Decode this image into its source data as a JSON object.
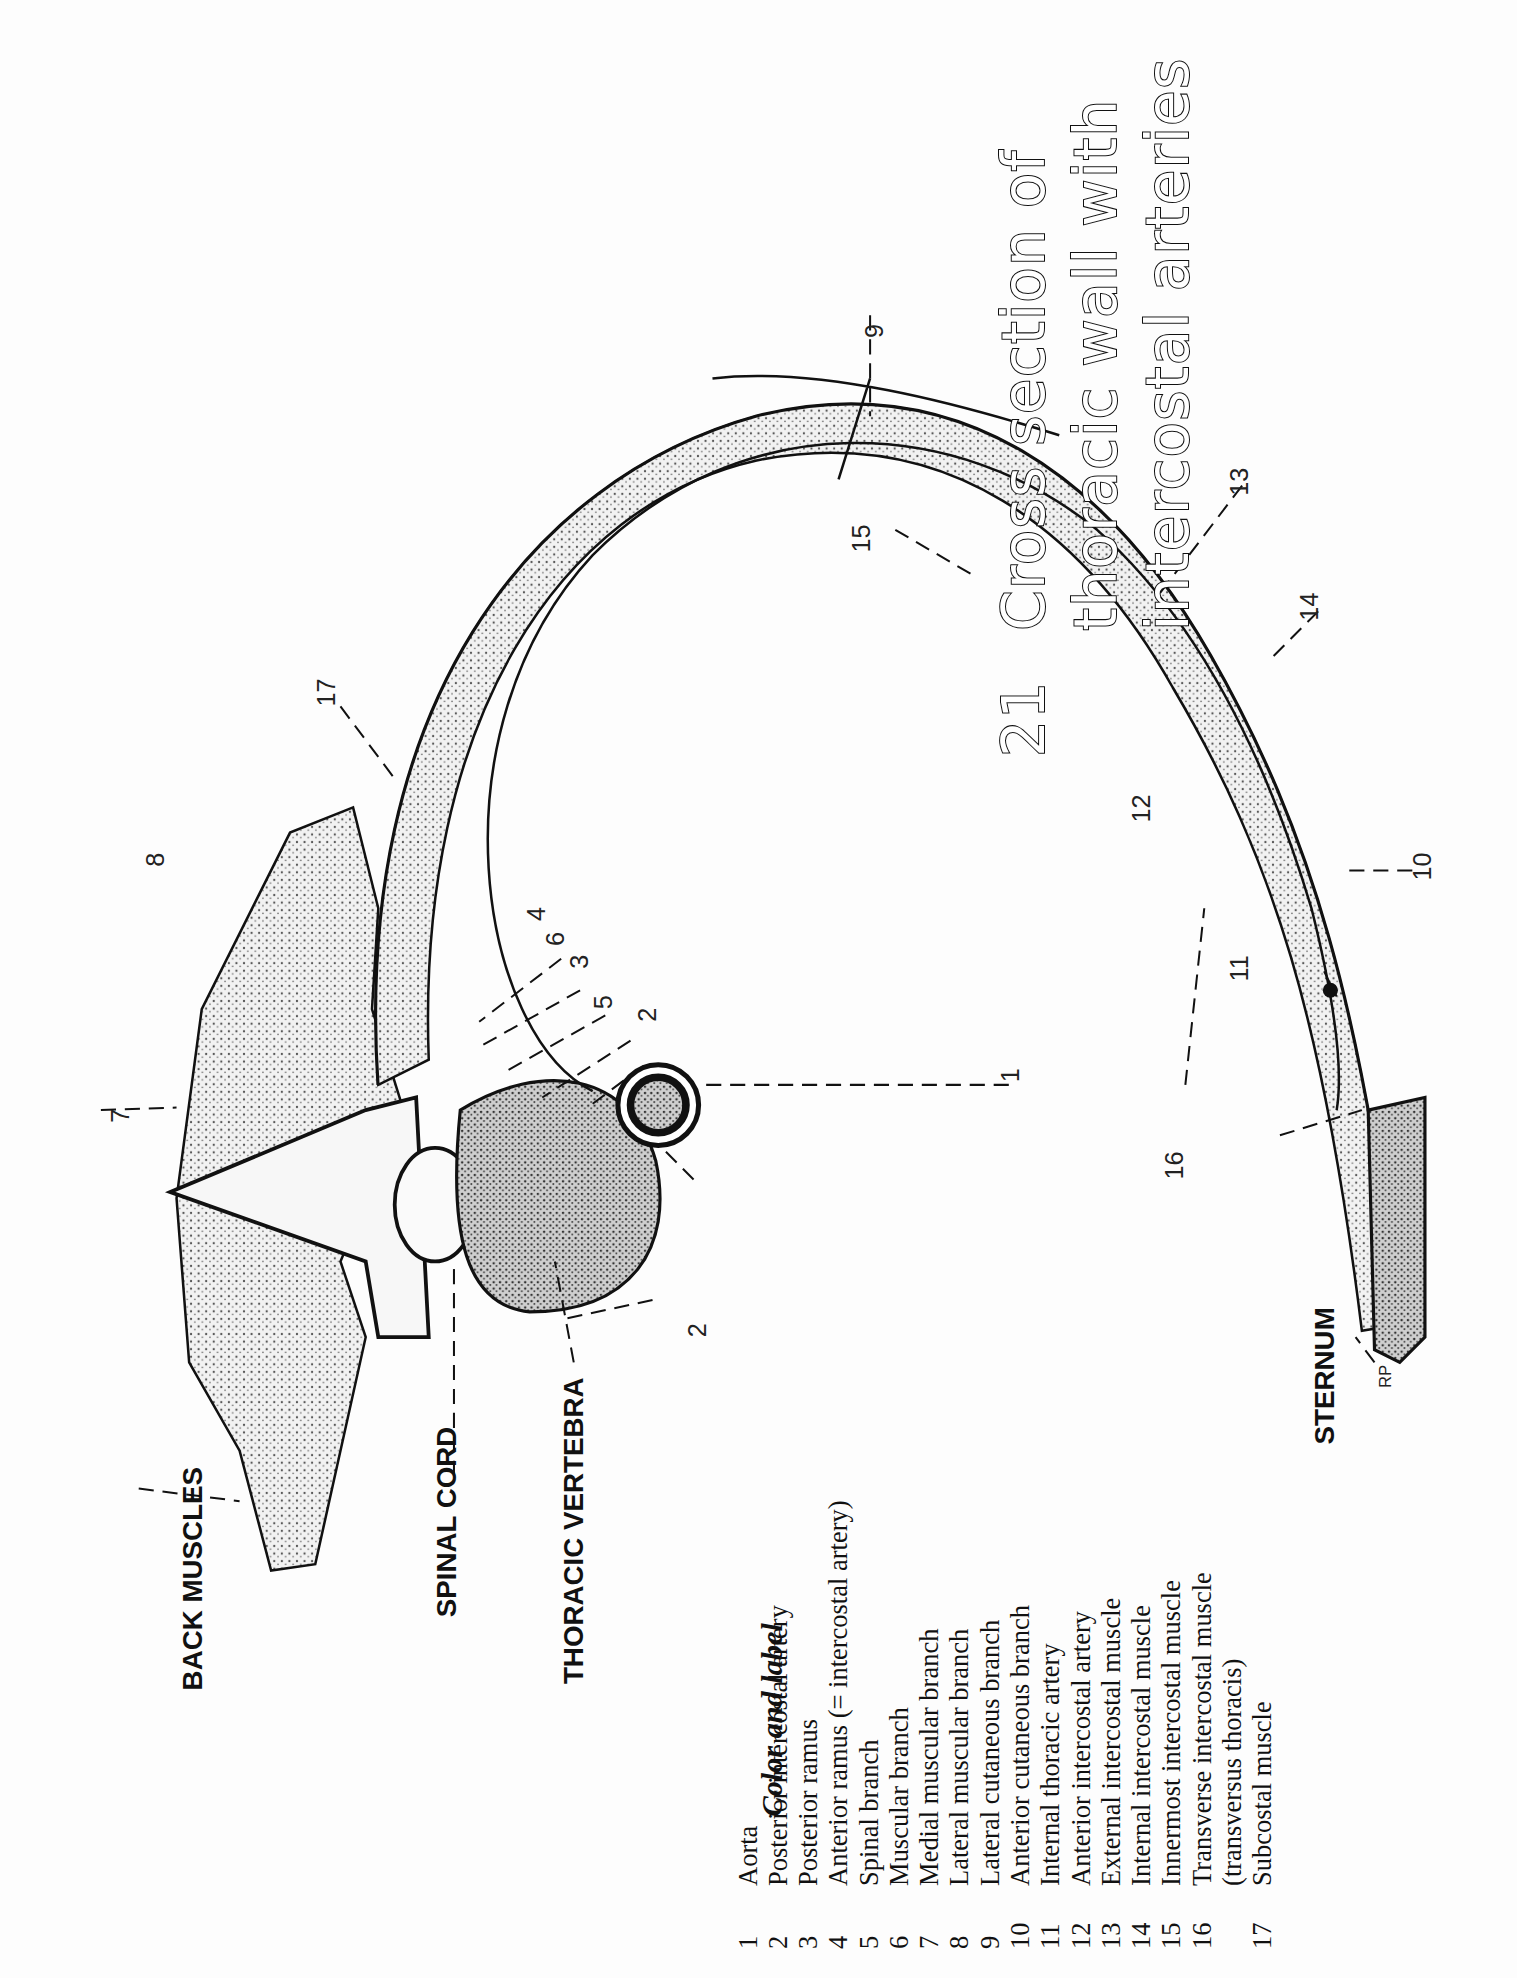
{
  "plate": {
    "number": "21",
    "title_lines": [
      "Cross section of",
      "thoracic wall with",
      "intercostal arteries"
    ]
  },
  "structures": {
    "back_muscles": "BACK MUSCLES",
    "spinal_cord": "SPINAL CORD",
    "thoracic_vertebra": "THORACIC VERTEBRA",
    "sternum": "STERNUM",
    "artist_initials": "RP"
  },
  "callouts": [
    "1",
    "2",
    "2",
    "3",
    "4",
    "5",
    "6",
    "7",
    "8",
    "9",
    "10",
    "11",
    "12",
    "13",
    "14",
    "15",
    "16",
    "17"
  ],
  "legend": {
    "heading": "Color and label",
    "items": [
      {
        "num": "1",
        "label": "Aorta"
      },
      {
        "num": "2",
        "label": "Posterior intercostal artery"
      },
      {
        "num": "3",
        "label": "Posterior ramus"
      },
      {
        "num": "4",
        "label": "Anterior ramus (= intercostal artery)"
      },
      {
        "num": "5",
        "label": "Spinal branch"
      },
      {
        "num": "6",
        "label": "Muscular branch"
      },
      {
        "num": "7",
        "label": "Medial muscular branch"
      },
      {
        "num": "8",
        "label": "Lateral muscular branch"
      },
      {
        "num": "9",
        "label": "Lateral cutaneous branch"
      },
      {
        "num": "10",
        "label": "Anterior cutaneous branch"
      },
      {
        "num": "11",
        "label": "Internal thoracic artery"
      },
      {
        "num": "12",
        "label": "Anterior intercostal artery"
      },
      {
        "num": "13",
        "label": "External intercostal muscle"
      },
      {
        "num": "14",
        "label": "Internal intercostal muscle"
      },
      {
        "num": "15",
        "label": "Innermost intercostal muscle"
      },
      {
        "num": "16",
        "label": "Transverse intercostal muscle"
      },
      {
        "num": "",
        "label": "(transversus thoracis)"
      },
      {
        "num": "17",
        "label": "Subcostal muscle"
      }
    ]
  }
}
